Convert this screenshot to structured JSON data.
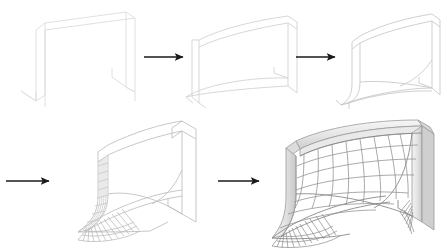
{
  "figure": {
    "background_color": "#ffffff",
    "width": 447,
    "height": 250,
    "stage_count": 5,
    "arrow_count": 4,
    "rows": [
      {
        "label": "top-row",
        "stage_indices": [
          0,
          1,
          2
        ]
      },
      {
        "label": "bottom-row",
        "stage_indices": [
          3,
          4
        ]
      }
    ]
  },
  "palette": {
    "background": "#ffffff",
    "wire_faint": "#dcdcdc",
    "wire_light": "#c9c9c9",
    "wire_mid": "#a8a8a8",
    "wire_dark": "#8a8a8a",
    "net_line": "#909090",
    "net_line_dark": "#6f6f6f",
    "post_fill_light": "#f2f2f2",
    "post_fill_mid": "#e2e2e2",
    "post_fill_dark": "#cfcfcf",
    "post_edge": "#9a9a9a",
    "arrow_color": "#1a1a1a",
    "fan_line": "#a0a0a0"
  },
  "stages": [
    {
      "id": "stage-1",
      "name": "bare-frame",
      "caption": "",
      "description": "Empty goal frame outline: two upright side planes and a straight crossbar, drawn as thin faint wireframe lines with no net surface.",
      "line_color": "#dcdcdc",
      "has_net_mesh": false,
      "has_fan_lines": false,
      "has_shaded_posts": false,
      "origin": {
        "x": 18,
        "y": 8
      },
      "size": {
        "width": 120,
        "height": 100
      }
    },
    {
      "id": "stage-2",
      "name": "curved-surface-begun",
      "caption": "",
      "description": "Frame with the first curved generatrix lines appearing: the crossbar bows upward and a sweeping curve traces the base of the net volume.",
      "line_color": "#d2d2d2",
      "has_net_mesh": false,
      "has_fan_lines": false,
      "has_shaded_posts": false,
      "origin": {
        "x": 192,
        "y": 12
      },
      "size": {
        "width": 118,
        "height": 96
      }
    },
    {
      "id": "stage-3",
      "name": "net-volume-defined",
      "caption": "",
      "description": "Net volume fully outlined: curved top rail, curved back wall, and the swept side profile define the enclosing surface in light wireframe.",
      "line_color": "#c9c9c9",
      "has_net_mesh": false,
      "has_fan_lines": false,
      "has_shaded_posts": false,
      "origin": {
        "x": 332,
        "y": 12
      },
      "size": {
        "width": 108,
        "height": 94
      }
    },
    {
      "id": "stage-4",
      "name": "partial-mesh",
      "caption": "",
      "description": "First mesh lines generated: vertical net strands on the near-left panel and a radiating fan of strands spreading across the bottom-left ground section.",
      "line_color": "#bdbdbd",
      "has_net_mesh": true,
      "has_fan_lines": true,
      "has_shaded_posts": false,
      "origin": {
        "x": 82,
        "y": 118
      },
      "size": {
        "width": 130,
        "height": 126
      }
    },
    {
      "id": "stage-5",
      "name": "complete-goal-net",
      "caption": "",
      "description": "Finished soccer goal: shaded three-dimensional posts and crossbar with a complete grid of net mesh, curved net sag, and fan strands anchoring both bottom corners.",
      "line_color": "#8a8a8a",
      "has_net_mesh": true,
      "has_fan_lines": true,
      "has_shaded_posts": true,
      "origin": {
        "x": 272,
        "y": 116
      },
      "size": {
        "width": 172,
        "height": 128
      }
    }
  ],
  "arrows": [
    {
      "id": "arrow-1",
      "name": "arrow-stage1-to-stage2",
      "direction": "right",
      "from_stage": "stage-1",
      "to_stage": "stage-2",
      "x1": 144,
      "y1": 57,
      "x2": 186,
      "y2": 57
    },
    {
      "id": "arrow-2",
      "name": "arrow-stage2-to-stage3",
      "direction": "right",
      "from_stage": "stage-2",
      "to_stage": "stage-3",
      "x1": 296,
      "y1": 57,
      "x2": 338,
      "y2": 57
    },
    {
      "id": "arrow-3",
      "name": "arrow-stage3-to-stage4",
      "direction": "right",
      "from_stage": "stage-3",
      "to_stage": "stage-4",
      "x1": 6,
      "y1": 181,
      "x2": 52,
      "y2": 181
    },
    {
      "id": "arrow-4",
      "name": "arrow-stage4-to-stage5",
      "direction": "right",
      "from_stage": "stage-4",
      "to_stage": "stage-5",
      "x1": 218,
      "y1": 181,
      "x2": 262,
      "y2": 181
    }
  ]
}
